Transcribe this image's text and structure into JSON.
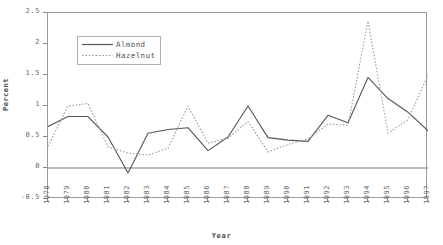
{
  "chart_data": {
    "type": "line",
    "title": "",
    "xlabel": "Year",
    "ylabel": "Percent",
    "grid": false,
    "legend_position": "upper-left-inside",
    "categories": [
      "1978",
      "1979",
      "1980",
      "1981",
      "1982",
      "1983",
      "1984",
      "1985",
      "1986",
      "1987",
      "1988",
      "1989",
      "1990",
      "1991",
      "1992",
      "1993",
      "1994",
      "1995",
      "1996",
      "1997"
    ],
    "x": [
      1978,
      1979,
      1980,
      1981,
      1982,
      1983,
      1984,
      1985,
      1986,
      1987,
      1988,
      1989,
      1990,
      1991,
      1992,
      1993,
      1994,
      1995,
      1996,
      1997
    ],
    "xlim": [
      1978,
      1997
    ],
    "ylim": [
      -0.5,
      2.5
    ],
    "y_ticks": [
      -0.5,
      0,
      0.5,
      1,
      1.5,
      2,
      2.5
    ],
    "y_tick_labels": [
      "-0.5",
      "0",
      "0.5",
      "1",
      "1.5",
      "2",
      "2.5"
    ],
    "series": [
      {
        "name": "Almond",
        "style": "solid",
        "color": "#555555",
        "values": [
          0.67,
          0.83,
          0.83,
          0.5,
          -0.08,
          0.56,
          0.62,
          0.65,
          0.28,
          0.5,
          1.0,
          0.49,
          0.45,
          0.43,
          0.85,
          0.73,
          1.46,
          1.12,
          0.9,
          0.6
        ]
      },
      {
        "name": "Hazelnut",
        "style": "dotted",
        "color": "#9a9a9a",
        "values": [
          0.35,
          1.0,
          1.04,
          0.34,
          0.24,
          0.21,
          0.32,
          1.0,
          0.4,
          0.48,
          0.75,
          0.26,
          0.38,
          0.47,
          0.71,
          0.69,
          2.37,
          0.56,
          0.78,
          1.5
        ]
      }
    ],
    "zero_line": 0
  },
  "axes": {
    "y_title": "Percent",
    "x_title": "Year"
  },
  "legend": {
    "entries": [
      {
        "label": "Almond"
      },
      {
        "label": "Hazelnut"
      }
    ]
  }
}
